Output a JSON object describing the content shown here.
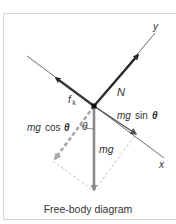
{
  "figure": {
    "caption": "Free-body diagram",
    "axes": {
      "x_label": "x",
      "y_label": "y"
    },
    "forces": {
      "normal": {
        "label": "N"
      },
      "friction": {
        "label_main": "f",
        "label_sub": "k"
      },
      "weight": {
        "label": "mg"
      },
      "parallel_component": {
        "label_mg": "mg",
        "label_fn": "sin",
        "label_theta": "θ"
      },
      "perpendicular_component": {
        "label_mg": "mg",
        "label_fn": "cos",
        "label_theta": "θ"
      }
    },
    "angle_label": "θ",
    "colors": {
      "normal_arrow": "#2b2b2b",
      "friction_arrow": "#3a3a3a",
      "weight_arrow": "#8a8a8a",
      "component_arrow": "#a8a8a8",
      "axis_line": "#707070",
      "construction_line": "#b5b5b5",
      "frame_border": "#d6d6d6"
    }
  }
}
